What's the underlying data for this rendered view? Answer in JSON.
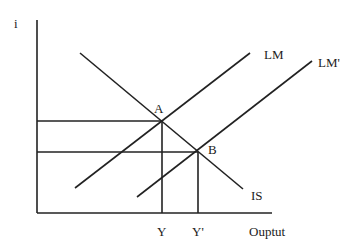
{
  "diagram": {
    "type": "IS-LM",
    "y_axis_label": "i",
    "x_axis_label": "Ouptut",
    "curves": [
      {
        "name": "IS",
        "label": "IS"
      },
      {
        "name": "LM",
        "label": "LM"
      },
      {
        "name": "LM'",
        "label": "LM'"
      }
    ],
    "points": [
      {
        "name": "A",
        "label": "A"
      },
      {
        "name": "B",
        "label": "B"
      }
    ],
    "x_ticks": [
      {
        "label": "Y"
      },
      {
        "label": "Y'"
      }
    ],
    "line_color": "#222222"
  }
}
